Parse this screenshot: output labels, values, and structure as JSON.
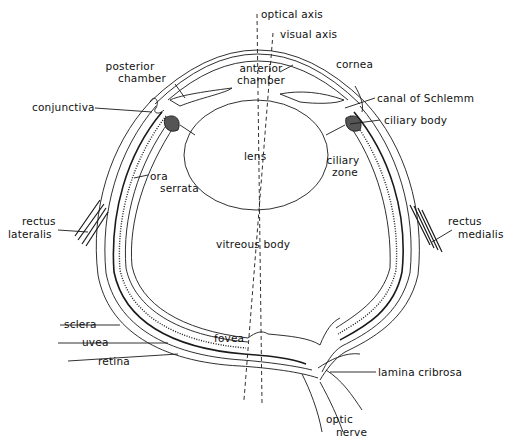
{
  "diagram": {
    "labels": {
      "optical_axis": "optical axis",
      "visual_axis": "visual axis",
      "posterior_chamber_1": "posterior",
      "posterior_chamber_2": "chamber",
      "anterior_chamber_1": "anterior",
      "anterior_chamber_2": "chamber",
      "cornea": "cornea",
      "conjunctiva": "conjunctiva",
      "canal_of_schlemm": "canal of Schlemm",
      "ciliary_body": "ciliary body",
      "lens": "lens",
      "ciliary_zone_1": "ciliary",
      "ciliary_zone_2": "zone",
      "ora_serrata_1": "ora",
      "ora_serrata_2": "serrata",
      "rectus_lateralis_1": "rectus",
      "rectus_lateralis_2": "lateralis",
      "rectus_medialis_1": "rectus",
      "rectus_medialis_2": "medialis",
      "vitreous_body": "vitreous body",
      "sclera": "sclera",
      "uvea": "uvea",
      "retina": "retina",
      "fovea": "fovea",
      "lamina_cribrosa": "lamina cribrosa",
      "optic_nerve_1": "optic",
      "optic_nerve_2": "nerve"
    },
    "colors": {
      "line": "#1a1a1a",
      "background": "#ffffff"
    }
  }
}
